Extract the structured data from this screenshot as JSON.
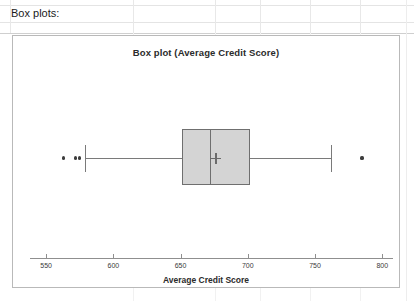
{
  "spreadsheet": {
    "cell_label": "Box plots:",
    "gridline_color": "#e8e8e8"
  },
  "chart_data": {
    "type": "box",
    "title": "Box plot (Average Credit Score)",
    "xlabel": "Average Credit Score",
    "ylabel": "",
    "orientation": "horizontal",
    "grid": false,
    "legend": "none",
    "xlim": [
      538,
      808
    ],
    "xticks": [
      550,
      600,
      650,
      700,
      750,
      800
    ],
    "xtick_labels": [
      "550",
      "600",
      "650",
      "700",
      "750",
      "800"
    ],
    "series": [
      {
        "name": "Average Credit Score",
        "whisker_low": 579,
        "q1": 651,
        "median": 672,
        "mean": 676,
        "q3": 702,
        "whisker_high": 762,
        "outliers": [
          563,
          572,
          575,
          785
        ],
        "box_fill": "#d4d4d4",
        "box_edge": "#6f6f6f",
        "whisker_color": "#7a7a7a",
        "outlier_color": "#3d3d3d",
        "mean_marker": "plus"
      }
    ]
  }
}
